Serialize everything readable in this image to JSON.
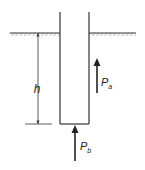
{
  "diagram": {
    "labels": {
      "depth": "h",
      "side_force_main": "P",
      "side_force_sub": "a",
      "base_force_main": "P",
      "base_force_sub": "b"
    },
    "colors": {
      "line": "#333333",
      "hatch": "#9a9a9a",
      "background": "#ffffff"
    }
  }
}
